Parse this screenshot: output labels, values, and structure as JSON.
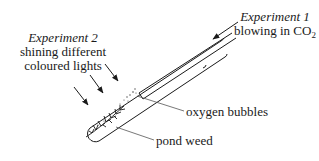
{
  "diagram": {
    "type": "labelled apparatus diagram",
    "experiment_1": {
      "title": "Experiment 1",
      "description": "blowing in CO",
      "subscript": "2"
    },
    "experiment_2": {
      "title": "Experiment 2",
      "line1": "shining different",
      "line2": "coloured lights"
    },
    "labels": {
      "bubbles": "oxygen bubbles",
      "weed": "pond weed"
    },
    "elements": [
      {
        "name": "test-tube",
        "shape": "tube",
        "orientation": "diagonal"
      },
      {
        "name": "delivery-tube",
        "shape": "straw",
        "inside": "test-tube"
      },
      {
        "name": "co2-arrow",
        "count": 1,
        "direction": "down-left"
      },
      {
        "name": "light-arrows",
        "count": 3,
        "direction": "down-right"
      },
      {
        "name": "oxygen-bubbles",
        "shape": "dots"
      },
      {
        "name": "pond-weed",
        "shape": "plant sprig"
      }
    ],
    "colors": {
      "ink": "#1a1a1a",
      "leader": "#555555",
      "background": "#ffffff"
    }
  }
}
